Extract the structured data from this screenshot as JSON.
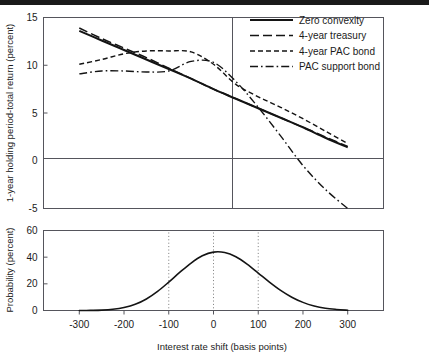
{
  "figure": {
    "xlabel": "Interest rate shift (basis points)",
    "top_ylabel": "1-year holding period-total return (percent)",
    "bottom_ylabel": "Probability (percent)"
  },
  "legend": {
    "items": [
      {
        "label": "Zero convexity",
        "style": "solid"
      },
      {
        "label": "4-year treasury",
        "style": "long-dash"
      },
      {
        "label": "4-year PAC bond",
        "style": "short-dash"
      },
      {
        "label": "PAC support bond",
        "style": "dash-dot"
      }
    ]
  },
  "ticks": {
    "x": [
      "-300",
      "-200",
      "-100",
      "0",
      "100",
      "200",
      "300"
    ],
    "y_top": [
      "15",
      "10",
      "5",
      "0",
      "-5"
    ],
    "y_bottom": [
      "60",
      "40",
      "20",
      "0"
    ]
  },
  "chart_data": {
    "type": "line",
    "title": "",
    "xlabel": "Interest rate shift (basis points)",
    "xlim": [
      -380,
      380
    ],
    "xticks": [
      -300,
      -200,
      -100,
      0,
      100,
      200,
      300
    ],
    "grid": false,
    "legend_position": "top-right",
    "panels": [
      {
        "name": "top",
        "ylabel": "1-year holding period-total return (percent)",
        "ylim": [
          -5,
          15
        ],
        "yticks": [
          15,
          10,
          5,
          0,
          -5
        ],
        "zero_lines": {
          "horizontal_y": 0,
          "vertical_x": 0
        },
        "x": [
          -300,
          -250,
          -200,
          -150,
          -100,
          -50,
          0,
          50,
          100,
          150,
          200,
          250,
          300
        ],
        "series": [
          {
            "name": "Zero convexity",
            "style": "solid",
            "values": [
              13.6,
              12.6,
              11.6,
              10.6,
              9.6,
              8.6,
              7.5,
              6.5,
              5.5,
              4.5,
              3.5,
              2.4,
              1.4
            ]
          },
          {
            "name": "4-year treasury",
            "style": "long-dash",
            "values": [
              13.9,
              12.8,
              11.8,
              10.8,
              9.7,
              8.6,
              7.5,
              6.5,
              5.5,
              4.5,
              3.5,
              2.5,
              1.5
            ]
          },
          {
            "name": "4-year PAC bond",
            "style": "short-dash",
            "values": [
              10.1,
              10.6,
              11.2,
              11.5,
              11.5,
              11.4,
              10.1,
              8.0,
              6.7,
              5.6,
              4.4,
              3.1,
              1.8
            ]
          },
          {
            "name": "PAC support bond",
            "style": "dash-dot",
            "values": [
              9.1,
              9.4,
              9.4,
              9.3,
              9.4,
              10.4,
              10.3,
              8.3,
              5.6,
              2.6,
              -0.5,
              -3.0,
              -5.2
            ]
          }
        ]
      },
      {
        "name": "bottom",
        "ylabel": "Probability (percent)",
        "ylim": [
          0,
          60
        ],
        "yticks": [
          60,
          40,
          20,
          0
        ],
        "dotted_gridlines_x": [
          -100,
          0,
          100
        ],
        "x": [
          -300,
          -275,
          -250,
          -225,
          -200,
          -175,
          -150,
          -125,
          -100,
          -75,
          -50,
          -25,
          0,
          25,
          50,
          75,
          100,
          125,
          150,
          175,
          200,
          225,
          250,
          275,
          300
        ],
        "series": [
          {
            "name": "Probability distribution",
            "style": "solid",
            "peak_value": 44,
            "peak_x": -10,
            "values": [
              0.0,
              0.1,
              0.3,
              0.9,
              2.2,
              4.6,
              8.6,
              14.3,
              21.3,
              28.7,
              35.6,
              41.0,
              43.8,
              43.5,
              40.3,
              34.8,
              28.1,
              21.3,
              15.1,
              10.0,
              6.1,
              3.4,
              1.7,
              0.8,
              0.2
            ]
          }
        ]
      }
    ]
  }
}
